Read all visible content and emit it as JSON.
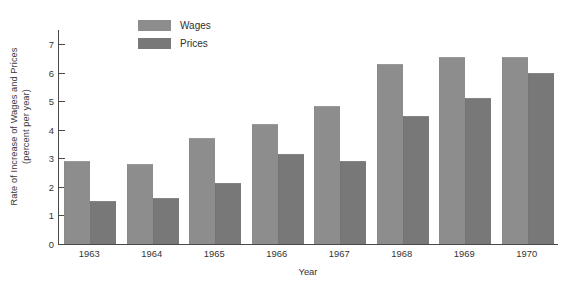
{
  "chart_data": {
    "type": "bar",
    "title": "",
    "xlabel": "Year",
    "ylabel": "Rate of Increase of Wages and Prices (percent per year)",
    "ylabel_line1": "Rate of Increase of Wages and Prices",
    "ylabel_line2": "(percent per year)",
    "categories": [
      "1963",
      "1964",
      "1965",
      "1966",
      "1967",
      "1968",
      "1969",
      "1970"
    ],
    "series": [
      {
        "name": "Wages",
        "color": "#8d8d8d",
        "values": [
          2.9,
          2.8,
          3.7,
          4.2,
          4.85,
          6.3,
          6.55,
          6.55
        ]
      },
      {
        "name": "Prices",
        "color": "#787878",
        "values": [
          1.5,
          1.6,
          2.15,
          3.15,
          2.9,
          4.5,
          5.1,
          6.0
        ]
      }
    ],
    "ylim": [
      0,
      7.5
    ],
    "yticks": [
      0,
      1,
      2,
      3,
      4,
      5,
      6,
      7
    ],
    "ytick_labels": [
      "0",
      "1",
      "2",
      "3",
      "4",
      "5",
      "6",
      "7"
    ],
    "grid": false,
    "legend_position": "top-center"
  },
  "legend": {
    "items": [
      {
        "label": "Wages",
        "color": "#8d8d8d"
      },
      {
        "label": "Prices",
        "color": "#787878"
      }
    ]
  }
}
